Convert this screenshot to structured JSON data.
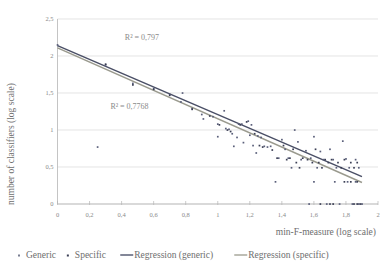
{
  "chart_data": {
    "type": "scatter",
    "title": "",
    "xlabel": "min-F-measure (log scale)",
    "ylabel": "number of classifiers (log scale)",
    "xlim": [
      0,
      2
    ],
    "ylim": [
      0,
      2.5
    ],
    "xticks": [
      "0",
      "0,2",
      "0,4",
      "0,6",
      "0,8",
      "1",
      "1,2",
      "1,4",
      "1,6",
      "1,8",
      "2"
    ],
    "xtick_values": [
      0,
      0.2,
      0.4,
      0.6,
      0.8,
      1,
      1.2,
      1.4,
      1.6,
      1.8,
      2
    ],
    "yticks": [
      "0",
      "0,5",
      "1",
      "1,5",
      "2",
      "2,5"
    ],
    "ytick_values": [
      0,
      0.5,
      1,
      1.5,
      2,
      2.5
    ],
    "grid": true,
    "legend_position": "bottom",
    "annotations": [
      {
        "text": "R² = 0,797",
        "x": 0.42,
        "y": 2.22
      },
      {
        "text": "R² = 0,7768",
        "x": 0.33,
        "y": 1.29
      }
    ],
    "series": [
      {
        "name": "Generic",
        "type": "scatter",
        "color": "#5a5f7a",
        "points": [
          [
            0.0,
            2.15
          ],
          [
            0.3,
            1.88
          ],
          [
            0.47,
            1.63
          ],
          [
            0.6,
            1.56
          ],
          [
            0.7,
            1.48
          ],
          [
            0.78,
            1.5
          ],
          [
            0.77,
            1.38
          ],
          [
            0.84,
            1.29
          ],
          [
            0.9,
            1.21
          ],
          [
            0.91,
            1.15
          ],
          [
            0.97,
            1.18
          ],
          [
            1.0,
            1.08
          ],
          [
            1.04,
            1.26
          ],
          [
            1.0,
            0.91
          ],
          [
            1.05,
            1.02
          ],
          [
            1.07,
            1.01
          ],
          [
            1.09,
            0.95
          ],
          [
            1.13,
            1.08
          ],
          [
            1.15,
            1.08
          ],
          [
            1.12,
            0.9
          ],
          [
            1.16,
            0.83
          ],
          [
            1.1,
            0.78
          ],
          [
            1.19,
            1.12
          ],
          [
            1.21,
            1.07
          ],
          [
            1.2,
            0.93
          ],
          [
            1.22,
            0.79
          ],
          [
            1.25,
            0.92
          ],
          [
            1.27,
            0.9
          ],
          [
            1.24,
            0.69
          ],
          [
            1.29,
            0.78
          ],
          [
            1.31,
            0.77
          ],
          [
            1.33,
            0.78
          ],
          [
            1.36,
            0.3
          ],
          [
            1.38,
            0.62
          ],
          [
            1.4,
            0.87
          ],
          [
            1.42,
            0.74
          ],
          [
            1.44,
            0.62
          ],
          [
            1.46,
            0.49
          ],
          [
            1.48,
            1.0
          ],
          [
            1.5,
            0.84
          ],
          [
            1.52,
            0.6
          ],
          [
            1.55,
            0.72
          ],
          [
            1.57,
            0.0
          ],
          [
            1.58,
            0.62
          ],
          [
            1.6,
            0.91
          ],
          [
            1.62,
            0.49
          ],
          [
            1.6,
            0.3
          ],
          [
            1.64,
            0.71
          ],
          [
            1.66,
            0.6
          ],
          [
            1.68,
            0.0
          ],
          [
            1.7,
            0.74
          ],
          [
            1.72,
            0.6
          ],
          [
            1.74,
            0.49
          ],
          [
            1.73,
            0.3
          ],
          [
            1.76,
            0.0
          ],
          [
            1.78,
            0.85
          ],
          [
            1.8,
            0.61
          ],
          [
            1.82,
            0.49
          ],
          [
            1.81,
            0.3
          ],
          [
            1.84,
            0.0
          ],
          [
            1.86,
            0.6
          ],
          [
            1.88,
            0.49
          ],
          [
            1.86,
            0.3
          ],
          [
            1.88,
            0.0
          ],
          [
            1.9,
            0.0
          ],
          [
            0.25,
            0.77
          ]
        ]
      },
      {
        "name": "Specific",
        "type": "scatter",
        "color": "#3b3f55",
        "points": [
          [
            0.3,
            1.89
          ],
          [
            0.47,
            1.61
          ],
          [
            0.6,
            1.55
          ],
          [
            0.7,
            1.47
          ],
          [
            0.84,
            1.28
          ],
          [
            0.95,
            1.19
          ],
          [
            1.01,
            1.07
          ],
          [
            1.06,
            1.0
          ],
          [
            1.08,
            0.98
          ],
          [
            1.14,
            1.07
          ],
          [
            1.18,
            1.11
          ],
          [
            1.23,
            0.95
          ],
          [
            1.26,
            0.79
          ],
          [
            1.28,
            0.77
          ],
          [
            1.34,
            0.73
          ],
          [
            1.37,
            0.62
          ],
          [
            1.41,
            0.79
          ],
          [
            1.43,
            0.6
          ],
          [
            1.45,
            0.62
          ],
          [
            1.47,
            0.74
          ],
          [
            1.49,
            0.56
          ],
          [
            1.51,
            0.49
          ],
          [
            1.53,
            0.62
          ],
          [
            1.56,
            0.6
          ],
          [
            1.59,
            0.56
          ],
          [
            1.61,
            0.74
          ],
          [
            1.63,
            0.56
          ],
          [
            1.65,
            0.49
          ],
          [
            1.67,
            0.6
          ],
          [
            1.69,
            0.56
          ],
          [
            1.71,
            0.6
          ],
          [
            1.75,
            0.56
          ],
          [
            1.77,
            0.49
          ],
          [
            1.79,
            0.6
          ],
          [
            1.83,
            0.56
          ],
          [
            1.85,
            0.49
          ],
          [
            1.87,
            0.56
          ],
          [
            1.79,
            0.3
          ],
          [
            1.83,
            0.3
          ],
          [
            1.87,
            0.3
          ],
          [
            1.85,
            0.0
          ],
          [
            1.87,
            0.0
          ],
          [
            1.89,
            0.0
          ],
          [
            1.64,
            0.0
          ],
          [
            1.7,
            0.0
          ],
          [
            1.72,
            0.0
          ]
        ]
      },
      {
        "name": "Regression (generic)",
        "type": "line",
        "color": "#4a4f66",
        "x": [
          0,
          1.9
        ],
        "y": [
          2.14,
          0.37
        ]
      },
      {
        "name": "Regression (specific)",
        "type": "line",
        "color": "#9a9a8e",
        "x": [
          0,
          1.9
        ],
        "y": [
          2.11,
          0.29
        ]
      }
    ]
  },
  "legend": {
    "items": [
      {
        "label": "Generic",
        "marker": "dot",
        "color": "#7a7f92"
      },
      {
        "label": "Specific",
        "marker": "dot",
        "color": "#3b3f55"
      },
      {
        "label": "Regression (generic)",
        "marker": "line",
        "color": "#5a5f76"
      },
      {
        "label": "Regression (specific)",
        "marker": "line",
        "color": "#a8a89c"
      }
    ]
  }
}
